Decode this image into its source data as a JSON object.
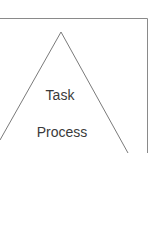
{
  "diagram": {
    "type": "pyramid",
    "levels": [
      {
        "label": "Task"
      },
      {
        "label": "Process"
      }
    ],
    "colors": {
      "stroke": "#7a7a7a",
      "frame": "#8a8a8a",
      "text": "#3a3a3a",
      "background": "#ffffff"
    }
  }
}
